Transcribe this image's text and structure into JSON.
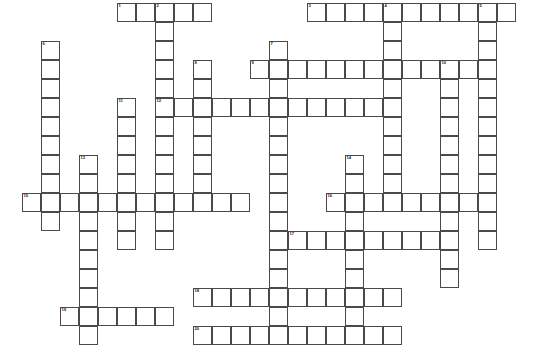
{
  "puzzle": {
    "title": "Crossword Puzzle Grid",
    "cell_size": 19,
    "origin_x": 22,
    "origin_y": 3,
    "columns": 27,
    "rows": 19,
    "border_color": "#4a4a4a",
    "cell_fill": "#ffffff",
    "background": "#ffffff",
    "number_color": "#1a1a1a",
    "entries": [
      {
        "number": 1,
        "direction": "across",
        "row": 0,
        "col": 5,
        "length": 5
      },
      {
        "number": 2,
        "direction": "down",
        "row": 0,
        "col": 7,
        "length": 10
      },
      {
        "number": 3,
        "direction": "across",
        "row": 0,
        "col": 15,
        "length": 11
      },
      {
        "number": 4,
        "direction": "down",
        "row": 0,
        "col": 19,
        "length": 10
      },
      {
        "number": 5,
        "direction": "down",
        "row": 0,
        "col": 24,
        "length": 11
      },
      {
        "number": 6,
        "direction": "down",
        "row": 2,
        "col": 1,
        "length": 10
      },
      {
        "number": 7,
        "direction": "down",
        "row": 2,
        "col": 13,
        "length": 15
      },
      {
        "number": 8,
        "direction": "down",
        "row": 3,
        "col": 9,
        "length": 8
      },
      {
        "number": 9,
        "direction": "across",
        "row": 3,
        "col": 12,
        "length": 13
      },
      {
        "number": 10,
        "direction": "down",
        "row": 3,
        "col": 22,
        "length": 9
      },
      {
        "number": 11,
        "direction": "down",
        "row": 5,
        "col": 5,
        "length": 8
      },
      {
        "number": 12,
        "direction": "across",
        "row": 5,
        "col": 7,
        "length": 13
      },
      {
        "number": 13,
        "direction": "down",
        "row": 8,
        "col": 3,
        "length": 10
      },
      {
        "number": 14,
        "direction": "down",
        "row": 8,
        "col": 17,
        "length": 8
      },
      {
        "number": 15,
        "direction": "across",
        "row": 10,
        "col": 0,
        "length": 12
      },
      {
        "number": 16,
        "direction": "across",
        "row": 10,
        "col": 16,
        "length": 9
      },
      {
        "number": 17,
        "direction": "across",
        "row": 12,
        "col": 14,
        "length": 8
      },
      {
        "number": 18,
        "direction": "across",
        "row": 15,
        "col": 9,
        "length": 11
      },
      {
        "number": 19,
        "direction": "across",
        "row": 15,
        "col": 2,
        "length": 6
      },
      {
        "number": 20,
        "direction": "across",
        "row": 17,
        "col": 9,
        "length": 11
      }
    ],
    "cells": [
      {
        "r": 0,
        "c": 5,
        "n": 1
      },
      {
        "r": 0,
        "c": 6
      },
      {
        "r": 0,
        "c": 7,
        "n": 2
      },
      {
        "r": 0,
        "c": 8
      },
      {
        "r": 0,
        "c": 9
      },
      {
        "r": 0,
        "c": 15,
        "n": 3
      },
      {
        "r": 0,
        "c": 16
      },
      {
        "r": 0,
        "c": 17
      },
      {
        "r": 0,
        "c": 18
      },
      {
        "r": 0,
        "c": 19,
        "n": 4
      },
      {
        "r": 0,
        "c": 20
      },
      {
        "r": 0,
        "c": 21
      },
      {
        "r": 0,
        "c": 22
      },
      {
        "r": 0,
        "c": 23
      },
      {
        "r": 0,
        "c": 24,
        "n": 5
      },
      {
        "r": 0,
        "c": 25
      },
      {
        "r": 1,
        "c": 7
      },
      {
        "r": 1,
        "c": 19
      },
      {
        "r": 1,
        "c": 24
      },
      {
        "r": 2,
        "c": 1,
        "n": 6
      },
      {
        "r": 2,
        "c": 7
      },
      {
        "r": 2,
        "c": 13,
        "n": 7
      },
      {
        "r": 2,
        "c": 19
      },
      {
        "r": 2,
        "c": 24
      },
      {
        "r": 3,
        "c": 1
      },
      {
        "r": 3,
        "c": 7
      },
      {
        "r": 3,
        "c": 9,
        "n": 8
      },
      {
        "r": 3,
        "c": 12,
        "n": 9
      },
      {
        "r": 3,
        "c": 13
      },
      {
        "r": 3,
        "c": 14
      },
      {
        "r": 3,
        "c": 15
      },
      {
        "r": 3,
        "c": 16
      },
      {
        "r": 3,
        "c": 17
      },
      {
        "r": 3,
        "c": 18
      },
      {
        "r": 3,
        "c": 19
      },
      {
        "r": 3,
        "c": 20
      },
      {
        "r": 3,
        "c": 21
      },
      {
        "r": 3,
        "c": 22,
        "n": 10
      },
      {
        "r": 3,
        "c": 23
      },
      {
        "r": 3,
        "c": 24
      },
      {
        "r": 4,
        "c": 1
      },
      {
        "r": 4,
        "c": 7
      },
      {
        "r": 4,
        "c": 9
      },
      {
        "r": 4,
        "c": 13
      },
      {
        "r": 4,
        "c": 19
      },
      {
        "r": 4,
        "c": 22
      },
      {
        "r": 4,
        "c": 24
      },
      {
        "r": 5,
        "c": 1
      },
      {
        "r": 5,
        "c": 5,
        "n": 11
      },
      {
        "r": 5,
        "c": 7,
        "n": 12
      },
      {
        "r": 5,
        "c": 8
      },
      {
        "r": 5,
        "c": 9
      },
      {
        "r": 5,
        "c": 10
      },
      {
        "r": 5,
        "c": 11
      },
      {
        "r": 5,
        "c": 12
      },
      {
        "r": 5,
        "c": 13
      },
      {
        "r": 5,
        "c": 14
      },
      {
        "r": 5,
        "c": 15
      },
      {
        "r": 5,
        "c": 16
      },
      {
        "r": 5,
        "c": 17
      },
      {
        "r": 5,
        "c": 18
      },
      {
        "r": 5,
        "c": 19
      },
      {
        "r": 5,
        "c": 22
      },
      {
        "r": 5,
        "c": 24
      },
      {
        "r": 6,
        "c": 1
      },
      {
        "r": 6,
        "c": 5
      },
      {
        "r": 6,
        "c": 7
      },
      {
        "r": 6,
        "c": 9
      },
      {
        "r": 6,
        "c": 13
      },
      {
        "r": 6,
        "c": 19
      },
      {
        "r": 6,
        "c": 22
      },
      {
        "r": 6,
        "c": 24
      },
      {
        "r": 7,
        "c": 1
      },
      {
        "r": 7,
        "c": 5
      },
      {
        "r": 7,
        "c": 7
      },
      {
        "r": 7,
        "c": 9
      },
      {
        "r": 7,
        "c": 13
      },
      {
        "r": 7,
        "c": 19
      },
      {
        "r": 7,
        "c": 22
      },
      {
        "r": 7,
        "c": 24
      },
      {
        "r": 8,
        "c": 1
      },
      {
        "r": 8,
        "c": 3,
        "n": 13
      },
      {
        "r": 8,
        "c": 5
      },
      {
        "r": 8,
        "c": 7
      },
      {
        "r": 8,
        "c": 9
      },
      {
        "r": 8,
        "c": 13
      },
      {
        "r": 8,
        "c": 17,
        "n": 14
      },
      {
        "r": 8,
        "c": 19
      },
      {
        "r": 8,
        "c": 22
      },
      {
        "r": 8,
        "c": 24
      },
      {
        "r": 9,
        "c": 1
      },
      {
        "r": 9,
        "c": 3
      },
      {
        "r": 9,
        "c": 5
      },
      {
        "r": 9,
        "c": 7
      },
      {
        "r": 9,
        "c": 9
      },
      {
        "r": 9,
        "c": 13
      },
      {
        "r": 9,
        "c": 17
      },
      {
        "r": 9,
        "c": 19
      },
      {
        "r": 9,
        "c": 22
      },
      {
        "r": 9,
        "c": 24
      },
      {
        "r": 10,
        "c": 0,
        "n": 15
      },
      {
        "r": 10,
        "c": 1
      },
      {
        "r": 10,
        "c": 2
      },
      {
        "r": 10,
        "c": 3
      },
      {
        "r": 10,
        "c": 4
      },
      {
        "r": 10,
        "c": 5
      },
      {
        "r": 10,
        "c": 6
      },
      {
        "r": 10,
        "c": 7
      },
      {
        "r": 10,
        "c": 8
      },
      {
        "r": 10,
        "c": 9
      },
      {
        "r": 10,
        "c": 10
      },
      {
        "r": 10,
        "c": 11
      },
      {
        "r": 10,
        "c": 13
      },
      {
        "r": 10,
        "c": 16,
        "n": 16
      },
      {
        "r": 10,
        "c": 17
      },
      {
        "r": 10,
        "c": 18
      },
      {
        "r": 10,
        "c": 19
      },
      {
        "r": 10,
        "c": 20
      },
      {
        "r": 10,
        "c": 21
      },
      {
        "r": 10,
        "c": 22
      },
      {
        "r": 10,
        "c": 23
      },
      {
        "r": 10,
        "c": 24
      },
      {
        "r": 11,
        "c": 1
      },
      {
        "r": 11,
        "c": 3
      },
      {
        "r": 11,
        "c": 5
      },
      {
        "r": 11,
        "c": 7
      },
      {
        "r": 11,
        "c": 13
      },
      {
        "r": 11,
        "c": 17
      },
      {
        "r": 11,
        "c": 22
      },
      {
        "r": 11,
        "c": 24
      },
      {
        "r": 12,
        "c": 3
      },
      {
        "r": 12,
        "c": 5
      },
      {
        "r": 12,
        "c": 7
      },
      {
        "r": 12,
        "c": 13
      },
      {
        "r": 12,
        "c": 14,
        "n": 17
      },
      {
        "r": 12,
        "c": 15
      },
      {
        "r": 12,
        "c": 16
      },
      {
        "r": 12,
        "c": 17
      },
      {
        "r": 12,
        "c": 18
      },
      {
        "r": 12,
        "c": 19
      },
      {
        "r": 12,
        "c": 20
      },
      {
        "r": 12,
        "c": 21
      },
      {
        "r": 12,
        "c": 22
      },
      {
        "r": 12,
        "c": 24
      },
      {
        "r": 13,
        "c": 3
      },
      {
        "r": 13,
        "c": 13
      },
      {
        "r": 13,
        "c": 17
      },
      {
        "r": 13,
        "c": 22
      },
      {
        "r": 14,
        "c": 3
      },
      {
        "r": 14,
        "c": 13
      },
      {
        "r": 14,
        "c": 17
      },
      {
        "r": 14,
        "c": 22
      },
      {
        "r": 15,
        "c": 3
      },
      {
        "r": 15,
        "c": 9,
        "n": 18
      },
      {
        "r": 15,
        "c": 10
      },
      {
        "r": 15,
        "c": 11
      },
      {
        "r": 15,
        "c": 12
      },
      {
        "r": 15,
        "c": 13
      },
      {
        "r": 15,
        "c": 14
      },
      {
        "r": 15,
        "c": 15
      },
      {
        "r": 15,
        "c": 16
      },
      {
        "r": 15,
        "c": 17
      },
      {
        "r": 15,
        "c": 18
      },
      {
        "r": 15,
        "c": 19
      },
      {
        "r": 16,
        "c": 2,
        "n": 19
      },
      {
        "r": 16,
        "c": 3
      },
      {
        "r": 16,
        "c": 4
      },
      {
        "r": 16,
        "c": 5
      },
      {
        "r": 16,
        "c": 6
      },
      {
        "r": 16,
        "c": 7
      },
      {
        "r": 16,
        "c": 13
      },
      {
        "r": 16,
        "c": 17
      },
      {
        "r": 17,
        "c": 3
      },
      {
        "r": 17,
        "c": 9,
        "n": 20
      },
      {
        "r": 17,
        "c": 10
      },
      {
        "r": 17,
        "c": 11
      },
      {
        "r": 17,
        "c": 12
      },
      {
        "r": 17,
        "c": 13
      },
      {
        "r": 17,
        "c": 14
      },
      {
        "r": 17,
        "c": 15
      },
      {
        "r": 17,
        "c": 16
      },
      {
        "r": 17,
        "c": 17
      },
      {
        "r": 17,
        "c": 18
      },
      {
        "r": 17,
        "c": 19
      }
    ]
  }
}
